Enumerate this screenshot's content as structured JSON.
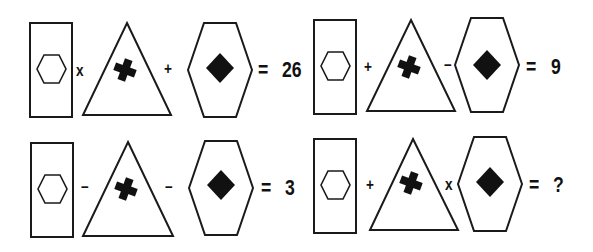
{
  "puzzle": {
    "type": "shape-math-puzzle",
    "colors": {
      "stroke": "#1a1a1a",
      "fill": "#111111",
      "background": "#ffffff"
    },
    "shape_legend": {
      "A": "rectangle containing small outlined hexagon",
      "B": "triangle containing tilted black cross",
      "C": "large hexagon containing black diamond"
    },
    "equations": [
      {
        "terms": [
          "A",
          "B",
          "C"
        ],
        "op1": "x",
        "op2": "+",
        "equals": "=",
        "result": "26"
      },
      {
        "terms": [
          "A",
          "B",
          "C"
        ],
        "op1": "+",
        "op2": "–",
        "equals": "=",
        "result": "9"
      },
      {
        "terms": [
          "A",
          "B",
          "C"
        ],
        "op1": "–",
        "op2": "–",
        "equals": "=",
        "result": "3"
      },
      {
        "terms": [
          "A",
          "B",
          "C"
        ],
        "op1": "+",
        "op2": "x",
        "equals": "=",
        "result": "?"
      }
    ]
  }
}
